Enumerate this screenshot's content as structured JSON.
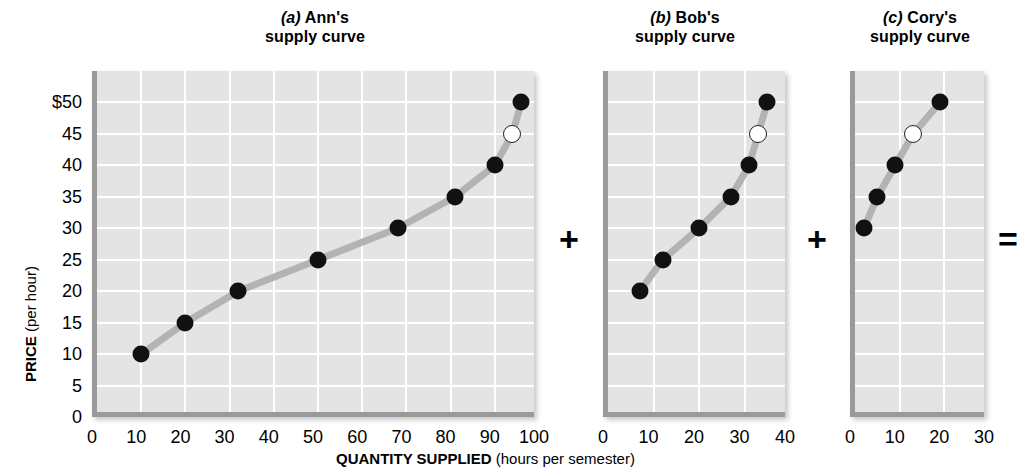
{
  "figure": {
    "axis_titles": {
      "y_bold": "PRICE",
      "y_regular": " (per hour)",
      "x_bold": "QUANTITY SUPPLIED",
      "x_regular": " (hours per semester)"
    },
    "operators": {
      "plus1": "+",
      "plus2": "+",
      "equals": "="
    },
    "colors": {
      "plot_background": "#e4e4e4",
      "gridline": "#ffffff",
      "axis_border": "#9a9a9a",
      "curve": "#b3b3b3",
      "marker_filled": "#111111",
      "marker_open": "#ffffff"
    }
  },
  "chart_data": [
    {
      "type": "line",
      "panel": "a",
      "title_label": "(a)",
      "title_name": " Ann's",
      "title_line2": "supply curve",
      "xlabel": "QUANTITY SUPPLIED (hours per semester)",
      "ylabel": "PRICE (per hour)",
      "xlim": [
        0,
        100
      ],
      "ylim": [
        0,
        55
      ],
      "xticks": [
        0,
        10,
        20,
        30,
        40,
        50,
        60,
        70,
        80,
        90,
        100
      ],
      "yticks": [
        0,
        5,
        10,
        15,
        20,
        25,
        30,
        35,
        40,
        45,
        50
      ],
      "ytick_labels": [
        "0",
        "5",
        "10",
        "15",
        "20",
        "25",
        "30",
        "35",
        "40",
        "45",
        "$50"
      ],
      "grid": true,
      "x": [
        10,
        20,
        32,
        50,
        68,
        81,
        90,
        94,
        96
      ],
      "y": [
        10,
        15,
        20,
        25,
        30,
        35,
        40,
        45,
        50
      ],
      "marker_styles": [
        "filled",
        "filled",
        "filled",
        "filled",
        "filled",
        "filled",
        "filled",
        "open",
        "filled"
      ]
    },
    {
      "type": "line",
      "panel": "b",
      "title_label": "(b)",
      "title_name": " Bob's",
      "title_line2": "supply curve",
      "xlim": [
        0,
        40
      ],
      "ylim": [
        0,
        55
      ],
      "xticks": [
        0,
        10,
        20,
        30,
        40
      ],
      "yticks": [
        0,
        5,
        10,
        15,
        20,
        25,
        30,
        35,
        40,
        45,
        50
      ],
      "grid": true,
      "x": [
        7,
        12,
        20,
        27,
        31,
        33,
        35
      ],
      "y": [
        20,
        25,
        30,
        35,
        40,
        45,
        50
      ],
      "marker_styles": [
        "filled",
        "filled",
        "filled",
        "filled",
        "filled",
        "open",
        "filled"
      ]
    },
    {
      "type": "line",
      "panel": "c",
      "title_label": "(c)",
      "title_name": " Cory's",
      "title_line2": "supply curve",
      "xlim": [
        0,
        30
      ],
      "ylim": [
        0,
        55
      ],
      "xticks": [
        0,
        10,
        20,
        30
      ],
      "yticks": [
        0,
        5,
        10,
        15,
        20,
        25,
        30,
        35,
        40,
        45,
        50
      ],
      "grid": true,
      "x": [
        2,
        5,
        9,
        13,
        19
      ],
      "y": [
        30,
        35,
        40,
        45,
        50
      ],
      "marker_styles": [
        "filled",
        "filled",
        "filled",
        "open",
        "filled"
      ]
    }
  ]
}
